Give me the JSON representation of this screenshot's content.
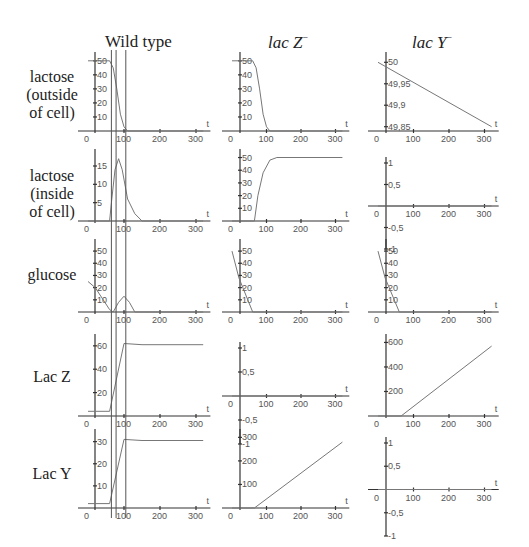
{
  "columns": [
    {
      "title": "Wild type",
      "italic": false,
      "sup": ""
    },
    {
      "title": "lac Z",
      "italic": true,
      "sup": "−"
    },
    {
      "title": "lac Y",
      "italic": true,
      "sup": "−"
    }
  ],
  "rows": [
    {
      "label_lines": [
        "lactose",
        "(outside",
        "of cell)"
      ]
    },
    {
      "label_lines": [
        "lactose",
        "(inside",
        "of cell)"
      ]
    },
    {
      "label_lines": [
        "glucose"
      ]
    },
    {
      "label_lines": [
        "Lac Z"
      ]
    },
    {
      "label_lines": [
        "Lac Y"
      ]
    }
  ],
  "axis_var": "t",
  "chart_data": [
    {
      "type": "line",
      "row": "lactose (outside of cell)",
      "column": "Wild type",
      "x": [
        0,
        60,
        70,
        80,
        90,
        100,
        110,
        320
      ],
      "y": [
        50,
        50,
        45,
        30,
        12,
        3,
        0,
        0
      ],
      "xticks": [
        "0",
        "100",
        "200",
        "300"
      ],
      "yticks": [
        "10",
        "20",
        "30",
        "40",
        "50"
      ],
      "ylim": [
        0,
        52
      ],
      "xlabel": "t"
    },
    {
      "type": "line",
      "row": "lactose (inside of cell)",
      "column": "Wild type",
      "x": [
        0,
        60,
        65,
        75,
        85,
        95,
        110,
        130,
        150,
        320
      ],
      "y": [
        0,
        0,
        5,
        14,
        17,
        14,
        6,
        2,
        0,
        0
      ],
      "xticks": [
        "0",
        "100",
        "200",
        "300"
      ],
      "yticks": [
        "5",
        "10",
        "15"
      ],
      "ylim": [
        0,
        18
      ],
      "xlabel": "t"
    },
    {
      "type": "line",
      "row": "glucose",
      "column": "Wild type",
      "x": [
        0,
        20,
        60,
        70,
        85,
        100,
        115,
        130,
        320
      ],
      "y": [
        25,
        20,
        2,
        0,
        8,
        13,
        8,
        0,
        0
      ],
      "xticks": [
        "0",
        "100",
        "200",
        "300"
      ],
      "yticks": [
        "10",
        "20",
        "30",
        "40",
        "50"
      ],
      "ylim": [
        0,
        55
      ],
      "xlabel": "t"
    },
    {
      "type": "line",
      "row": "Lac Z",
      "column": "Wild type",
      "x": [
        0,
        60,
        100,
        150,
        320
      ],
      "y": [
        4,
        4,
        62,
        61,
        61
      ],
      "xticks": [
        "0",
        "100",
        "200",
        "300"
      ],
      "yticks": [
        "20",
        "40",
        "60"
      ],
      "ylim": [
        0,
        65
      ],
      "xlabel": "t"
    },
    {
      "type": "line",
      "row": "Lac Y",
      "column": "Wild type",
      "x": [
        0,
        60,
        100,
        150,
        320
      ],
      "y": [
        2,
        2,
        31,
        30.5,
        30.5
      ],
      "xticks": [
        "0",
        "100",
        "200",
        "300"
      ],
      "yticks": [
        "10",
        "20",
        "30"
      ],
      "ylim": [
        0,
        33
      ],
      "xlabel": "t"
    },
    {
      "type": "line",
      "row": "lactose (outside of cell)",
      "column": "lac Z-",
      "x": [
        0,
        60,
        70,
        80,
        90,
        100,
        110,
        320
      ],
      "y": [
        50,
        50,
        45,
        30,
        12,
        3,
        0,
        0
      ],
      "xticks": [
        "0",
        "100",
        "200",
        "300"
      ],
      "yticks": [
        "10",
        "20",
        "30",
        "40",
        "50"
      ],
      "ylim": [
        0,
        52
      ],
      "xlabel": "t"
    },
    {
      "type": "line",
      "row": "lactose (inside of cell)",
      "column": "lac Z-",
      "x": [
        0,
        65,
        75,
        90,
        110,
        130,
        320
      ],
      "y": [
        0,
        0,
        20,
        38,
        48,
        50,
        50
      ],
      "xticks": [
        "0",
        "100",
        "200",
        "300"
      ],
      "yticks": [
        "10",
        "20",
        "30",
        "40",
        "50"
      ],
      "ylim": [
        0,
        52
      ],
      "xlabel": "t"
    },
    {
      "type": "line",
      "row": "glucose",
      "column": "lac Z-",
      "x": [
        0,
        20,
        60,
        320
      ],
      "y": [
        50,
        28,
        0,
        0
      ],
      "xticks": [
        "0",
        "100",
        "200",
        "300"
      ],
      "yticks": [
        "10",
        "20",
        "30",
        "40",
        "50"
      ],
      "ylim": [
        0,
        55
      ],
      "xlabel": "t"
    },
    {
      "type": "line",
      "row": "Lac Z",
      "column": "lac Z-",
      "x": [
        0,
        320
      ],
      "y": [
        0,
        0
      ],
      "xticks": [
        "0",
        "100",
        "200",
        "300"
      ],
      "yticks": [
        "-1",
        "-0,5",
        "0,5",
        "1"
      ],
      "ylim": [
        -1,
        1
      ],
      "xlabel": "t"
    },
    {
      "type": "line",
      "row": "Lac Y",
      "column": "lac Z-",
      "x": [
        0,
        65,
        320
      ],
      "y": [
        0,
        0,
        280
      ],
      "xticks": [
        "0",
        "100",
        "200",
        "300"
      ],
      "yticks": [
        "100",
        "200",
        "300"
      ],
      "ylim": [
        0,
        310
      ],
      "xlabel": "t"
    },
    {
      "type": "line",
      "row": "lactose (outside of cell)",
      "column": "lac Y-",
      "x": [
        0,
        320
      ],
      "y": [
        50,
        49.85
      ],
      "xticks": [
        "0",
        "100",
        "200",
        "300"
      ],
      "yticks": [
        "49,85",
        "49,9",
        "49,95",
        "50"
      ],
      "ylim": [
        49.84,
        50.01
      ],
      "xlabel": "t"
    },
    {
      "type": "line",
      "row": "lactose (inside of cell)",
      "column": "lac Y-",
      "x": [
        0,
        320
      ],
      "y": [
        0,
        0
      ],
      "xticks": [
        "0",
        "100",
        "200",
        "300"
      ],
      "yticks": [
        "-1",
        "-0,5",
        "0,5",
        "1"
      ],
      "ylim": [
        -1,
        1
      ],
      "xlabel": "t"
    },
    {
      "type": "line",
      "row": "glucose",
      "column": "lac Y-",
      "x": [
        0,
        20,
        60,
        320
      ],
      "y": [
        50,
        28,
        0,
        0
      ],
      "xticks": [
        "0",
        "100",
        "200",
        "300"
      ],
      "yticks": [
        "10",
        "20",
        "30",
        "40",
        "50"
      ],
      "ylim": [
        0,
        55
      ],
      "xlabel": "t"
    },
    {
      "type": "line",
      "row": "Lac Z",
      "column": "lac Y-",
      "x": [
        0,
        65,
        320
      ],
      "y": [
        0,
        0,
        570
      ],
      "xticks": [
        "0",
        "100",
        "200",
        "300"
      ],
      "yticks": [
        "200",
        "400",
        "600"
      ],
      "ylim": [
        0,
        620
      ],
      "xlabel": "t"
    },
    {
      "type": "line",
      "row": "Lac Y",
      "column": "lac Y-",
      "x": [
        0,
        320
      ],
      "y": [
        0,
        0
      ],
      "xticks": [
        "0",
        "100",
        "200",
        "300"
      ],
      "yticks": [
        "-1",
        "-0,5",
        "0,5",
        "1"
      ],
      "ylim": [
        -1,
        1
      ],
      "xlabel": "t"
    }
  ],
  "wildtype_marker_lines_t": [
    65,
    78,
    105
  ]
}
